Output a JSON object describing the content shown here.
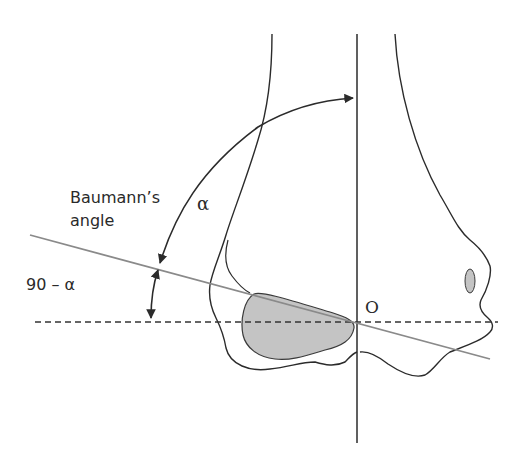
{
  "figure": {
    "labels": {
      "baumann_line1": "Baumann’s",
      "baumann_line2": "angle",
      "alpha": "α",
      "ninety_minus_alpha": "90 – α",
      "origin": "O"
    },
    "colors": {
      "outline": "#2b2b2b",
      "baumann_line": "#8a8a8a",
      "shaded_fill": "#c4c4c4",
      "dashed_line": "#333333",
      "background": "#ffffff"
    }
  }
}
